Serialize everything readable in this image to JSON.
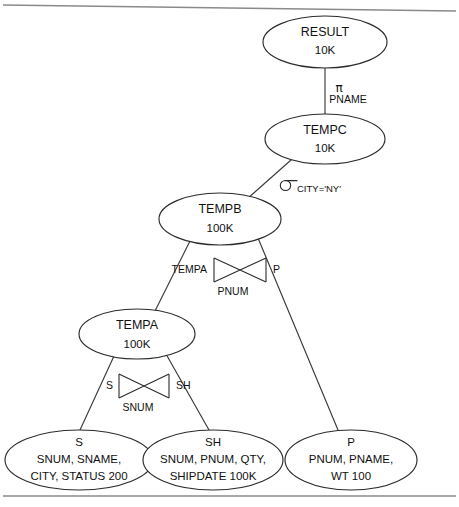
{
  "diagram": {
    "type": "query-execution-tree",
    "nodes": [
      {
        "id": "result",
        "title": "RESULT",
        "lines": [
          "10K"
        ],
        "cx": 325,
        "cy": 42,
        "rx": 62,
        "ry": 26
      },
      {
        "id": "tempc",
        "title": "TEMPC",
        "lines": [
          "10K"
        ],
        "cx": 325,
        "cy": 139,
        "rx": 60,
        "ry": 25
      },
      {
        "id": "tempb",
        "title": "TEMPB",
        "lines": [
          "100K"
        ],
        "cx": 220,
        "cy": 219,
        "rx": 61,
        "ry": 26
      },
      {
        "id": "tempa",
        "title": "TEMPA",
        "lines": [
          "100K"
        ],
        "cx": 137,
        "cy": 334,
        "rx": 58,
        "ry": 25
      },
      {
        "id": "s",
        "title": "S",
        "lines": [
          "SNUM, SNAME,",
          "CITY, STATUS 200"
        ],
        "cx": 79,
        "cy": 460,
        "rx": 74,
        "ry": 30
      },
      {
        "id": "sh",
        "title": "SH",
        "lines": [
          "SNUM, PNUM, QTY,",
          "SHIPDATE 100K"
        ],
        "cx": 213,
        "cy": 460,
        "rx": 70,
        "ry": 30
      },
      {
        "id": "p",
        "title": "P",
        "lines": [
          "PNUM, PNAME,",
          "WT 100"
        ],
        "cx": 351,
        "cy": 460,
        "rx": 66,
        "ry": 30
      }
    ],
    "edges": [
      {
        "id": "result-tempc",
        "from": "result",
        "to": "tempc",
        "x1": 325,
        "y1": 68,
        "x2": 325,
        "y2": 114
      },
      {
        "id": "tempc-tempb",
        "from": "tempc",
        "to": "tempb",
        "x1": 291,
        "y1": 160,
        "x2": 247,
        "y2": 199
      },
      {
        "id": "tempb-tempa",
        "from": "tempb",
        "to": "tempa",
        "x1": 190,
        "y1": 241,
        "x2": 155,
        "y2": 311
      },
      {
        "id": "tempb-p",
        "from": "tempb",
        "to": "p",
        "x1": 258,
        "y1": 238,
        "x2": 338,
        "y2": 430
      },
      {
        "id": "tempa-s",
        "from": "tempa",
        "to": "s",
        "x1": 114,
        "y1": 356,
        "x2": 80,
        "y2": 430
      },
      {
        "id": "tempa-sh",
        "from": "tempa",
        "to": "sh",
        "x1": 166,
        "y1": 354,
        "x2": 209,
        "y2": 430
      }
    ],
    "operators": [
      {
        "id": "projection",
        "kind": "projection",
        "symbol": "π",
        "attribute": "PNAME",
        "x": 338,
        "y": 88
      },
      {
        "id": "selection",
        "kind": "selection",
        "symbol": "σ",
        "condition": "CITY='NY'",
        "x": 285,
        "y": 183
      },
      {
        "id": "join-tempb",
        "kind": "join",
        "left_label": "TEMPA",
        "right_label": "P",
        "attribute": "PNUM",
        "x": 227,
        "y": 270
      },
      {
        "id": "join-tempa",
        "kind": "join",
        "left_label": "S",
        "right_label": "SH",
        "attribute": "SNUM",
        "x": 132,
        "y": 386
      }
    ],
    "rules": [
      {
        "id": "top-rule",
        "x1": 3,
        "y1": 5,
        "x2": 456,
        "y2": 11
      },
      {
        "id": "bottom-rule",
        "x1": 3,
        "y1": 496,
        "x2": 456,
        "y2": 496
      }
    ]
  }
}
